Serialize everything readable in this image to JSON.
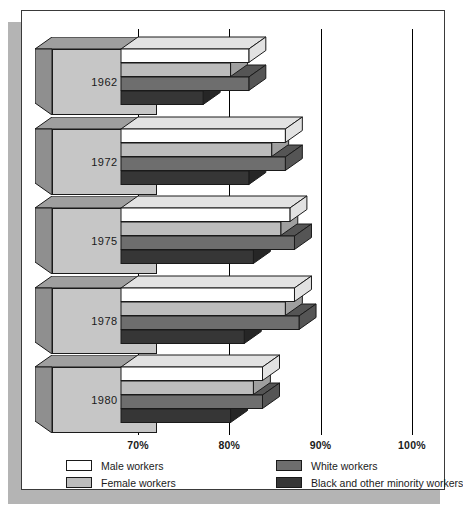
{
  "chart_data": {
    "type": "bar",
    "orientation": "horizontal",
    "style": "3d-grouped-horizontal-bar",
    "title": "",
    "subtitle": "",
    "xlabel": "",
    "ylabel": "",
    "xlim": [
      70,
      103
    ],
    "grid": true,
    "grid_axis": "x",
    "axis_start_percent": 70,
    "legend_position": "bottom",
    "categories": [
      "1962",
      "1972",
      "1975",
      "1978",
      "1980"
    ],
    "tick_labels": [
      "70%",
      "80%",
      "90%",
      "100%"
    ],
    "tick_values": [
      70,
      80,
      90,
      100
    ],
    "series": [
      {
        "name": "Male workers",
        "color": "#ffffff",
        "top_color": "#e2e2e2",
        "values": [
          84.0,
          88.0,
          88.5,
          89.0,
          85.5
        ]
      },
      {
        "name": "Female workers",
        "color": "#bdbdbd",
        "top_color": "#9f9f9f",
        "values": [
          82.0,
          86.5,
          87.5,
          88.0,
          84.5
        ]
      },
      {
        "name": "White workers",
        "color": "#6e6e6e",
        "top_color": "#555555",
        "values": [
          84.0,
          88.0,
          89.0,
          89.5,
          85.5
        ]
      },
      {
        "name": "Black and other minority workers",
        "color": "#363636",
        "top_color": "#262626",
        "values": [
          79.0,
          84.0,
          84.5,
          83.5,
          82.0
        ]
      }
    ]
  },
  "legend": {
    "columns": [
      {
        "entries": [
          {
            "label": "Male workers",
            "swatch": "#ffffff"
          },
          {
            "label": "Female workers",
            "swatch": "#bdbdbd"
          }
        ]
      },
      {
        "entries": [
          {
            "label": "White workers",
            "swatch": "#6e6e6e"
          },
          {
            "label": "Black and other minority workers",
            "swatch": "#363636"
          }
        ]
      }
    ]
  },
  "colors": {
    "page_background": "#ffffff",
    "page_border": "#3a3a3a",
    "page_shadow": "#b4b4b4",
    "gridline": "#000000",
    "year_block_front": "#c6c6c6",
    "year_block_top": "#9f9f9f",
    "year_block_side": "#8f8f8f",
    "text": "#1a1a1a"
  }
}
